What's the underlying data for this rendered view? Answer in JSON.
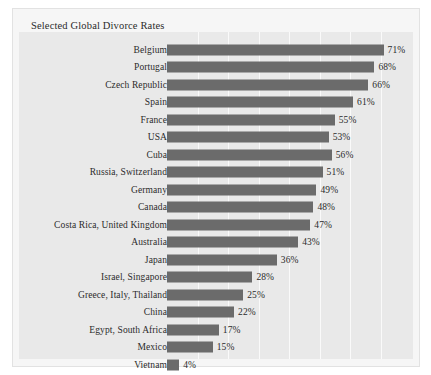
{
  "card": {
    "title": "Selected Global Divorce Rates"
  },
  "chart_data": {
    "type": "bar",
    "orientation": "horizontal",
    "title": "Selected Global Divorce Rates",
    "xlabel": "",
    "ylabel": "",
    "xlim": [
      0,
      80
    ],
    "grid": true,
    "gridline_interval": 10,
    "gridline_values": [
      10,
      20,
      30,
      40,
      50,
      60,
      70
    ],
    "legend": "none",
    "value_suffix": "%",
    "bar_color": "#6b6b6b",
    "plot_background": "#e9e9e9",
    "card_background": "#f6f6f6",
    "categories": [
      "Belgium",
      "Portugal",
      "Czech Republic",
      "Spain",
      "France",
      "USA",
      "Cuba",
      "Russia, Switzerland",
      "Germany",
      "Canada",
      "Costa Rica, United Kingdom",
      "Australia",
      "Japan",
      "Israel, Singapore",
      "Greece, Italy, Thailand",
      "China",
      "Egypt, South Africa",
      "Mexico",
      "Vietnam"
    ],
    "values": [
      71,
      68,
      66,
      61,
      55,
      53,
      56,
      51,
      49,
      48,
      47,
      43,
      36,
      28,
      25,
      22,
      17,
      15,
      4
    ],
    "value_labels": [
      "71%",
      "68%",
      "66%",
      "61%",
      "55%",
      "53%",
      "56%",
      "51%",
      "49%",
      "48%",
      "47%",
      "43%",
      "36%",
      "28%",
      "25%",
      "22%",
      "17%",
      "15%",
      "4%"
    ],
    "bar_lengths_percent": [
      71,
      68,
      66,
      61,
      55,
      53,
      54,
      51,
      49,
      48,
      47,
      43,
      36,
      28,
      25,
      22,
      17,
      15,
      4
    ]
  }
}
